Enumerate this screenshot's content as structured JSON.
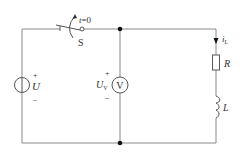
{
  "diagram": {
    "type": "circuit",
    "colors": {
      "wire": "#8a8a8a",
      "component": "#555555",
      "text": "#333333",
      "node": "#111111"
    },
    "source": {
      "name": "U",
      "plus": "+",
      "minus": "–",
      "symbol": "voltage-source"
    },
    "switch": {
      "name": "S",
      "time_label": "t=0",
      "time_var": "t",
      "time_eq": "=0"
    },
    "voltmeter": {
      "symbol_letter": "V",
      "voltage_label": "U",
      "voltage_sub": "V",
      "plus": "+",
      "minus": "–"
    },
    "branch": {
      "current_label": "i",
      "current_sub": "L",
      "resistor": "R",
      "inductor": "L"
    }
  }
}
